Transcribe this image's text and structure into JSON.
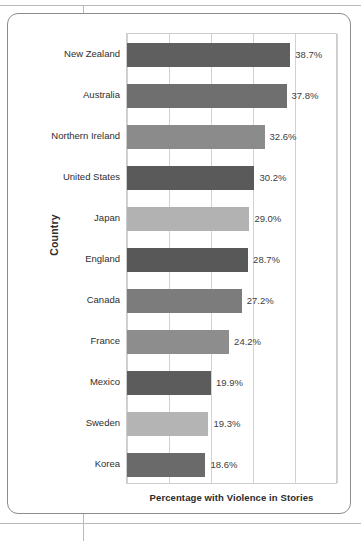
{
  "figure": {
    "axis_title_y": "Country",
    "axis_title_x": "Percentage with Violence in Stories"
  },
  "chart_data": {
    "type": "bar",
    "orientation": "horizontal",
    "title": "",
    "xlabel": "Percentage with Violence in Stories",
    "ylabel": "Country",
    "xlim": [
      0,
      50
    ],
    "grid": true,
    "gridline_count": 6,
    "legend": null,
    "categories": [
      "New Zealand",
      "Australia",
      "Northern Ireland",
      "United States",
      "Japan",
      "England",
      "Canada",
      "France",
      "Mexico",
      "Sweden",
      "Korea"
    ],
    "values": [
      38.7,
      37.8,
      32.6,
      30.2,
      29.0,
      28.7,
      27.2,
      24.2,
      19.9,
      19.3,
      18.6
    ],
    "value_labels": [
      "38.7%",
      "37.8%",
      "32.6%",
      "30.2%",
      "29.0%",
      "28.7%",
      "27.2%",
      "24.2%",
      "19.9%",
      "19.3%",
      "18.6%"
    ],
    "bar_colors": [
      "#5f5f5f",
      "#6f6f6f",
      "#8b8b8b",
      "#5a5a5a",
      "#b2b2b2",
      "#585858",
      "#7c7c7c",
      "#8d8d8d",
      "#5c5c5c",
      "#b4b4b4",
      "#6a6a6a"
    ]
  }
}
